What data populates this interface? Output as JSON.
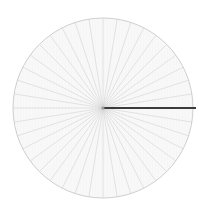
{
  "figure": {
    "background_color": "#ffffff",
    "canvas": {
      "width": 216,
      "height": 218
    }
  },
  "chart_data": {
    "type": "line",
    "subtitle": "",
    "xlabel": "",
    "ylabel": "",
    "grid": false,
    "legend_position": "none",
    "projection": "polar",
    "center": {
      "x": 103,
      "y": 108
    },
    "radius": 90,
    "disc": {
      "fill_color": "#fbfbfb",
      "outline_color": "#c9c9c9",
      "outline_width": 0.9
    },
    "spokes": {
      "count": 40,
      "angle_step_degrees": 9,
      "start_angle_degrees": 0,
      "faint_color": "#cfcfcf",
      "faint_width": 0.55,
      "inner_radius": 0,
      "outer_radius": 90
    },
    "highlight_spoke": {
      "angle_degrees": 0,
      "color": "#3c3c3c",
      "width": 2.1,
      "inner_radius": 0,
      "outer_radius": 93,
      "label": ""
    },
    "hub": {
      "radius": 1.6,
      "color": "#9a9a9a"
    },
    "annotations": [],
    "tick_labels": [],
    "legend_entries": []
  }
}
